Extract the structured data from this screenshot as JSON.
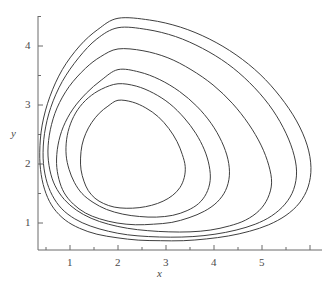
{
  "figure": {
    "background_color": "#ffffff",
    "curve_color": "#3f3f3f",
    "axis_color": "#6b6b6b",
    "text_color": "#4a4a4a"
  },
  "chart_data": {
    "type": "line",
    "title": "",
    "subtitle": "",
    "xlabel": "x",
    "ylabel": "y",
    "grid": false,
    "legend": null,
    "xlim": [
      0.0,
      6.35
    ],
    "ylim": [
      0.0,
      4.78
    ],
    "xticks": [
      1,
      2,
      3,
      4,
      5
    ],
    "yticks": [
      1,
      2,
      3,
      4
    ],
    "xtick_labels": [
      "1",
      "2",
      "3",
      "4",
      "5"
    ],
    "ytick_labels": [
      "1",
      "2",
      "3",
      "4"
    ],
    "x_minor_tick_step": 0.5,
    "y_minor_tick_step": 0.5,
    "annotations": [],
    "center": [
      2.0,
      2.0
    ],
    "series": [
      {
        "name": "orbit-1",
        "closed": true,
        "x_range": [
          1.22,
          3.4
        ],
        "y_range": [
          1.25,
          3.08
        ],
        "points": [
          [
            2.0,
            3.08
          ],
          [
            2.3,
            3.05
          ],
          [
            2.58,
            2.95
          ],
          [
            2.84,
            2.8
          ],
          [
            3.06,
            2.6
          ],
          [
            3.23,
            2.38
          ],
          [
            3.34,
            2.16
          ],
          [
            3.4,
            1.96
          ],
          [
            3.38,
            1.77
          ],
          [
            3.29,
            1.6
          ],
          [
            3.14,
            1.47
          ],
          [
            2.94,
            1.37
          ],
          [
            2.7,
            1.3
          ],
          [
            2.44,
            1.26
          ],
          [
            2.17,
            1.25
          ],
          [
            1.92,
            1.27
          ],
          [
            1.7,
            1.33
          ],
          [
            1.52,
            1.42
          ],
          [
            1.38,
            1.55
          ],
          [
            1.29,
            1.71
          ],
          [
            1.23,
            1.9
          ],
          [
            1.22,
            2.1
          ],
          [
            1.25,
            2.32
          ],
          [
            1.33,
            2.52
          ],
          [
            1.45,
            2.7
          ],
          [
            1.61,
            2.86
          ],
          [
            1.79,
            2.98
          ],
          [
            2.0,
            3.08
          ]
        ]
      },
      {
        "name": "orbit-2",
        "closed": true,
        "x_range": [
          0.92,
          3.92
        ],
        "y_range": [
          1.1,
          3.36
        ],
        "points": [
          [
            2.0,
            3.36
          ],
          [
            2.38,
            3.32
          ],
          [
            2.74,
            3.2
          ],
          [
            3.08,
            3.02
          ],
          [
            3.38,
            2.78
          ],
          [
            3.62,
            2.52
          ],
          [
            3.8,
            2.24
          ],
          [
            3.9,
            1.97
          ],
          [
            3.92,
            1.72
          ],
          [
            3.84,
            1.5
          ],
          [
            3.68,
            1.33
          ],
          [
            3.44,
            1.21
          ],
          [
            3.14,
            1.13
          ],
          [
            2.8,
            1.1
          ],
          [
            2.45,
            1.11
          ],
          [
            2.1,
            1.15
          ],
          [
            1.76,
            1.23
          ],
          [
            1.48,
            1.35
          ],
          [
            1.25,
            1.5
          ],
          [
            1.09,
            1.69
          ],
          [
            0.98,
            1.91
          ],
          [
            0.92,
            2.15
          ],
          [
            0.93,
            2.42
          ],
          [
            1.01,
            2.68
          ],
          [
            1.16,
            2.92
          ],
          [
            1.38,
            3.12
          ],
          [
            1.66,
            3.27
          ],
          [
            2.0,
            3.36
          ]
        ]
      },
      {
        "name": "orbit-3",
        "closed": true,
        "x_range": [
          0.72,
          4.32
        ],
        "y_range": [
          0.97,
          3.6
        ],
        "points": [
          [
            2.0,
            3.6
          ],
          [
            2.44,
            3.56
          ],
          [
            2.87,
            3.43
          ],
          [
            3.28,
            3.23
          ],
          [
            3.64,
            2.98
          ],
          [
            3.94,
            2.69
          ],
          [
            4.16,
            2.38
          ],
          [
            4.29,
            2.08
          ],
          [
            4.32,
            1.8
          ],
          [
            4.24,
            1.55
          ],
          [
            4.06,
            1.35
          ],
          [
            3.8,
            1.2
          ],
          [
            3.48,
            1.09
          ],
          [
            3.12,
            1.01
          ],
          [
            2.74,
            0.98
          ],
          [
            2.36,
            0.97
          ],
          [
            1.98,
            1.0
          ],
          [
            1.62,
            1.07
          ],
          [
            1.32,
            1.17
          ],
          [
            1.07,
            1.32
          ],
          [
            0.88,
            1.51
          ],
          [
            0.77,
            1.74
          ],
          [
            0.72,
            2.01
          ],
          [
            0.75,
            2.32
          ],
          [
            0.86,
            2.63
          ],
          [
            1.06,
            2.93
          ],
          [
            1.34,
            3.2
          ],
          [
            1.65,
            3.42
          ],
          [
            2.0,
            3.6
          ]
        ]
      },
      {
        "name": "orbit-4",
        "closed": true,
        "x_range": [
          0.54,
          5.2
        ],
        "y_range": [
          0.85,
          3.95
        ],
        "points": [
          [
            2.0,
            3.95
          ],
          [
            2.52,
            3.92
          ],
          [
            3.04,
            3.8
          ],
          [
            3.52,
            3.6
          ],
          [
            3.98,
            3.34
          ],
          [
            4.38,
            3.03
          ],
          [
            4.72,
            2.68
          ],
          [
            4.98,
            2.32
          ],
          [
            5.14,
            1.98
          ],
          [
            5.2,
            1.68
          ],
          [
            5.12,
            1.42
          ],
          [
            4.94,
            1.21
          ],
          [
            4.66,
            1.05
          ],
          [
            4.32,
            0.95
          ],
          [
            3.92,
            0.88
          ],
          [
            3.5,
            0.85
          ],
          [
            3.06,
            0.85
          ],
          [
            2.62,
            0.87
          ],
          [
            2.2,
            0.91
          ],
          [
            1.8,
            0.98
          ],
          [
            1.44,
            1.08
          ],
          [
            1.13,
            1.22
          ],
          [
            0.88,
            1.4
          ],
          [
            0.69,
            1.63
          ],
          [
            0.58,
            1.9
          ],
          [
            0.54,
            2.22
          ],
          [
            0.59,
            2.58
          ],
          [
            0.73,
            2.95
          ],
          [
            0.98,
            3.31
          ],
          [
            1.32,
            3.62
          ],
          [
            1.64,
            3.82
          ],
          [
            2.0,
            3.95
          ]
        ]
      },
      {
        "name": "orbit-5",
        "closed": true,
        "x_range": [
          0.44,
          5.72
        ],
        "y_range": [
          0.76,
          4.31
        ],
        "points": [
          [
            2.0,
            4.31
          ],
          [
            2.6,
            4.28
          ],
          [
            3.2,
            4.16
          ],
          [
            3.76,
            3.96
          ],
          [
            4.28,
            3.7
          ],
          [
            4.74,
            3.38
          ],
          [
            5.14,
            3.01
          ],
          [
            5.44,
            2.62
          ],
          [
            5.64,
            2.23
          ],
          [
            5.72,
            1.88
          ],
          [
            5.66,
            1.57
          ],
          [
            5.48,
            1.32
          ],
          [
            5.2,
            1.12
          ],
          [
            4.86,
            0.98
          ],
          [
            4.46,
            0.88
          ],
          [
            4.02,
            0.81
          ],
          [
            3.56,
            0.77
          ],
          [
            3.1,
            0.76
          ],
          [
            2.64,
            0.77
          ],
          [
            2.2,
            0.8
          ],
          [
            1.8,
            0.86
          ],
          [
            1.42,
            0.95
          ],
          [
            1.1,
            1.07
          ],
          [
            0.83,
            1.24
          ],
          [
            0.63,
            1.47
          ],
          [
            0.5,
            1.75
          ],
          [
            0.44,
            2.1
          ],
          [
            0.47,
            2.52
          ],
          [
            0.6,
            2.96
          ],
          [
            0.84,
            3.4
          ],
          [
            1.18,
            3.8
          ],
          [
            1.56,
            4.12
          ],
          [
            2.0,
            4.31
          ]
        ]
      },
      {
        "name": "orbit-6",
        "closed": true,
        "x_range": [
          0.37,
          6.02
        ],
        "y_range": [
          0.7,
          4.47
        ],
        "points": [
          [
            2.0,
            4.47
          ],
          [
            2.66,
            4.44
          ],
          [
            3.3,
            4.32
          ],
          [
            3.9,
            4.12
          ],
          [
            4.46,
            3.85
          ],
          [
            4.96,
            3.52
          ],
          [
            5.38,
            3.14
          ],
          [
            5.72,
            2.73
          ],
          [
            5.94,
            2.32
          ],
          [
            6.02,
            1.94
          ],
          [
            5.96,
            1.61
          ],
          [
            5.78,
            1.34
          ],
          [
            5.5,
            1.13
          ],
          [
            5.14,
            0.97
          ],
          [
            4.74,
            0.86
          ],
          [
            4.3,
            0.78
          ],
          [
            3.84,
            0.73
          ],
          [
            3.36,
            0.7
          ],
          [
            2.88,
            0.7
          ],
          [
            2.42,
            0.71
          ],
          [
            1.98,
            0.75
          ],
          [
            1.56,
            0.81
          ],
          [
            1.2,
            0.91
          ],
          [
            0.9,
            1.05
          ],
          [
            0.66,
            1.25
          ],
          [
            0.5,
            1.5
          ],
          [
            0.4,
            1.82
          ],
          [
            0.37,
            2.2
          ],
          [
            0.42,
            2.66
          ],
          [
            0.58,
            3.14
          ],
          [
            0.84,
            3.6
          ],
          [
            1.2,
            4.0
          ],
          [
            1.58,
            4.28
          ],
          [
            2.0,
            4.47
          ]
        ]
      }
    ]
  }
}
